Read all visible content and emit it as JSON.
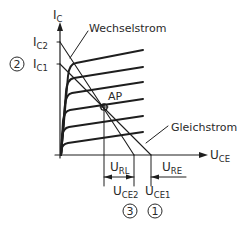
{
  "diagram": {
    "type": "transistor-output-characteristic",
    "colors": {
      "stroke": "#1e1e1e",
      "text": "#2a2a2a",
      "background": "#ffffff"
    },
    "axes": {
      "y": {
        "symbol": "I",
        "subscript": "C"
      },
      "x": {
        "symbol": "U",
        "subscript": "CE"
      }
    },
    "y_ticks": [
      {
        "symbol": "I",
        "subscript": "C2"
      },
      {
        "symbol": "I",
        "subscript": "C1",
        "marker": "2"
      }
    ],
    "x_ticks": [
      {
        "symbol": "U",
        "subscript": "CE2",
        "marker": "3"
      },
      {
        "symbol": "U",
        "subscript": "CE1",
        "marker": "1"
      }
    ],
    "operating_point": {
      "label": "AP"
    },
    "load_lines": [
      {
        "label": "Wechselstrom"
      },
      {
        "label": "Gleichstrom"
      }
    ],
    "voltage_spans": [
      {
        "symbol": "U",
        "subscript": "RL"
      },
      {
        "symbol": "U",
        "subscript": "RE"
      }
    ],
    "characteristic_curve_count": 6
  }
}
